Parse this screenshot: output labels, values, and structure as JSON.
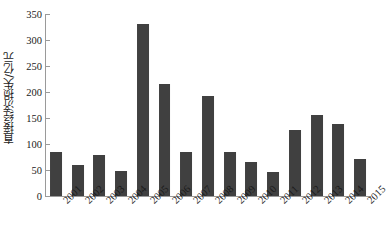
{
  "chart_data": {
    "type": "bar",
    "title": "",
    "subtitle": "",
    "xlabel": "",
    "ylabel": "直接经济损失/亿元",
    "categories": [
      "2001",
      "2002",
      "2003",
      "2004",
      "2005",
      "2006",
      "2007",
      "2008",
      "2009",
      "2010",
      "2011",
      "2012",
      "2013",
      "2014",
      "2015"
    ],
    "values": [
      85,
      60,
      78,
      48,
      330,
      215,
      85,
      192,
      85,
      65,
      47,
      126,
      155,
      138,
      72
    ],
    "series": [
      {
        "name": "直接经济损失",
        "values": [
          85,
          60,
          78,
          48,
          330,
          215,
          85,
          192,
          85,
          65,
          47,
          126,
          155,
          138,
          72
        ]
      }
    ],
    "ylim": [
      0,
      350
    ],
    "yticks": [
      0,
      50,
      100,
      150,
      200,
      250,
      300,
      350
    ],
    "ytick_labels": [
      "0",
      "50",
      "100",
      "150",
      "200",
      "250",
      "300",
      "350"
    ],
    "xtick_labels": [
      "2001",
      "2002",
      "2003",
      "2004",
      "2005",
      "2006",
      "2007",
      "2008",
      "2009",
      "2010",
      "2011",
      "2012",
      "2013",
      "2014",
      "2015"
    ],
    "xtick_rotation": -45,
    "grid": false,
    "legend": false,
    "legend_position": "none",
    "annotations": [],
    "bar_color": "#404040",
    "bar_edge_color": "#2b2b2b",
    "axis_color": "#9a9a9a",
    "text_color": "#1a1a1a",
    "background_color": "#ffffff",
    "bar_width_ratio": 0.55,
    "units": "亿元"
  }
}
